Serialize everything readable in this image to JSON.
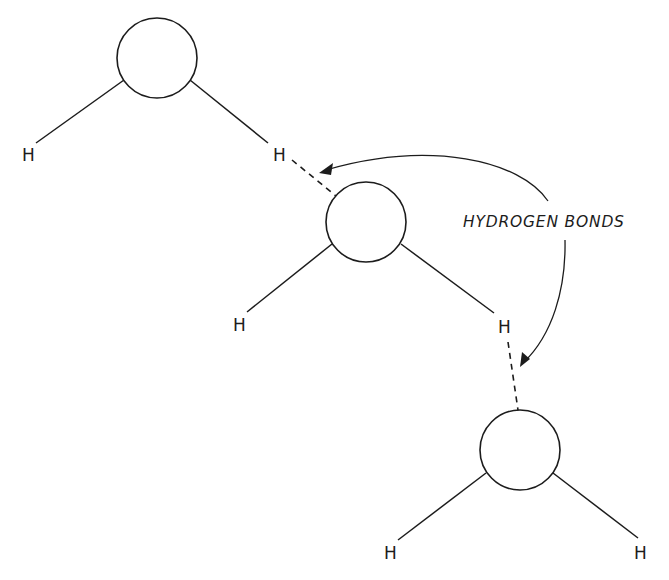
{
  "diagram": {
    "colors": {
      "ink": "#1c1c1c",
      "background": "#ffffff"
    },
    "callout": {
      "label": "HYDROGEN BONDS"
    },
    "molecules": [
      {
        "id": "molecule-1",
        "oxygen": {
          "cx": 157,
          "cy": 58,
          "r": 40
        },
        "hydrogens": [
          {
            "label": "H",
            "x": 28,
            "y": 161
          },
          {
            "label": "H",
            "x": 279,
            "y": 161
          }
        ]
      },
      {
        "id": "molecule-2",
        "oxygen": {
          "cx": 366,
          "cy": 222,
          "r": 40
        },
        "hydrogens": [
          {
            "label": "H",
            "x": 240,
            "y": 331
          },
          {
            "label": "H",
            "x": 505,
            "y": 333
          }
        ]
      },
      {
        "id": "molecule-3",
        "oxygen": {
          "cx": 520,
          "cy": 450,
          "r": 40
        },
        "hydrogens": [
          {
            "label": "H",
            "x": 391,
            "y": 559
          },
          {
            "label": "H",
            "x": 641,
            "y": 559
          }
        ]
      }
    ],
    "hydrogen_bonds": [
      {
        "from": "molecule-1 H (right)",
        "to": "molecule-2 O"
      },
      {
        "from": "molecule-2 H (right)",
        "to": "molecule-3 O"
      }
    ]
  }
}
